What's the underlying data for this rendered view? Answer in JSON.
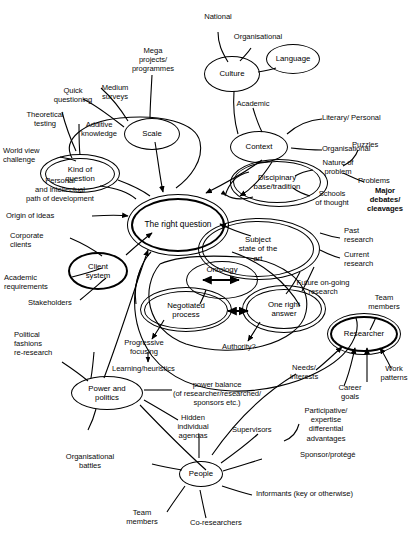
{
  "diagram": {
    "nodes": [
      {
        "id": "culture",
        "label": "Culture"
      },
      {
        "id": "language",
        "label": "Language"
      },
      {
        "id": "scale",
        "label": "Scale"
      },
      {
        "id": "context",
        "label": "Context"
      },
      {
        "id": "kind",
        "label": "Kind of\nquestion"
      },
      {
        "id": "rightq",
        "label": "The right question"
      },
      {
        "id": "disciplinary",
        "label": "Discipinary\nbase/tradition"
      },
      {
        "id": "subject",
        "label": "Subject\nstate of the\nart"
      },
      {
        "id": "client",
        "label": "Client\nsystem"
      },
      {
        "id": "ontology",
        "label": "Ontology"
      },
      {
        "id": "negotiated",
        "label": "Negotiated\nprocess"
      },
      {
        "id": "onerightans",
        "label": "One right\nanswer"
      },
      {
        "id": "researcher",
        "label": "Researcher"
      },
      {
        "id": "power",
        "label": "Power and\npolitics"
      },
      {
        "id": "people",
        "label": "People"
      }
    ],
    "labels": {
      "national": "National",
      "organisational_culture": "Organisational",
      "mega": "Mega\nprojects/\nprogrammes",
      "quick_questioning": "Quick\nquestioning",
      "medium_surveys": "Medium\nsurveys",
      "theoretical_testing": "Theoretical\ntesting",
      "additive_knowledge": "Additive\nknowledge",
      "world_view": "World view\nchallenge",
      "academic_context": "Academic",
      "literary_personal": "Literary/ Personal",
      "organisational_context": "Organisational",
      "puzzles": "Puzzles",
      "nature_of_problem": "Nature of\nproblem",
      "problems": "Problems",
      "schools_of_thought": "Schools\nof thought",
      "major_debates": "Major\ndebates/\ncleavages",
      "past_research": "Past\nresearch",
      "current_research": "Current\nresearch",
      "future_research": "Future on-going\nresearch",
      "personal_path": "Personal\nand intellectual\npath of development",
      "origin_of_ideas": "Origin of ideas",
      "corporate_clients": "Corporate\nclients",
      "academic_requirements": "Academic\nrequirements",
      "stakeholders": "Stakeholders",
      "political_fashions": "Political\nfashions\nre-research",
      "progressive_focusing": "Progressive\nfocusing",
      "learning_heuristics": "Learning/heuristics",
      "authority": "Authority?",
      "power_balance": "power balance\n(of researcher/researched/\nsponsors etc.)",
      "hidden_agendas": "Hidden\nindividual\nagendas",
      "organisational_battles": "Organisational\nbattles",
      "team_members_people": "Team\nmembers",
      "co_researchers": "Co-researchers",
      "supervisors": "Supervisors",
      "sponsor_protege": "Sponsor/protégé",
      "informants": "Informants (key or otherwise)",
      "needs_interests": "Needs/\ninterests",
      "career_goals": "Career\ngoals",
      "work_patterns": "Work\npatterns",
      "team_members_researcher": "Team\nmembers",
      "participative": "Participative/\nexpertise\ndifferential\nadvantages"
    },
    "colors": {
      "ink": "#000000",
      "background": "#ffffff"
    }
  }
}
